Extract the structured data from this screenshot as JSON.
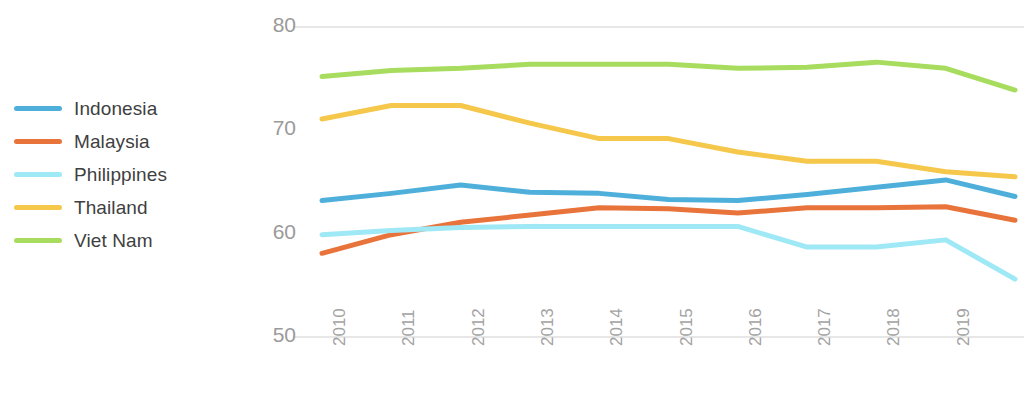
{
  "legend": {
    "position": "left",
    "items": [
      {
        "label": "Indonesia",
        "color": "#4FAFDB"
      },
      {
        "label": "Malaysia",
        "color": "#E8743B"
      },
      {
        "label": "Philippines",
        "color": "#9FE8F5"
      },
      {
        "label": "Thailand",
        "color": "#F5C84B"
      },
      {
        "label": "Viet Nam",
        "color": "#A8DC5E"
      }
    ]
  },
  "chart_data": {
    "type": "line",
    "title": "",
    "subtitle": "",
    "xlabel": "",
    "ylabel": "",
    "x": [
      2010,
      2011,
      2012,
      2013,
      2014,
      2015,
      2016,
      2017,
      2018,
      2019,
      2020
    ],
    "categories": [
      "2010",
      "2011",
      "2012",
      "2013",
      "2014",
      "2015",
      "2016",
      "2017",
      "2018",
      "2019",
      "2020"
    ],
    "ylim": [
      50,
      80
    ],
    "yticks": [
      50,
      60,
      70,
      80
    ],
    "ytick_labels": [
      "50",
      "60",
      "70",
      "80"
    ],
    "grid": "horizontal-top-and-bottom",
    "legend_position": "left",
    "series": [
      {
        "name": "Indonesia",
        "color": "#4FAFDB",
        "values": [
          63.2,
          63.9,
          64.7,
          64.0,
          63.9,
          63.3,
          63.2,
          63.8,
          64.5,
          65.2,
          63.6
        ]
      },
      {
        "name": "Malaysia",
        "color": "#E8743B",
        "values": [
          58.1,
          59.9,
          61.1,
          61.8,
          62.5,
          62.4,
          62.0,
          62.5,
          62.5,
          62.6,
          61.3
        ]
      },
      {
        "name": "Philippines",
        "color": "#9FE8F5",
        "values": [
          59.9,
          60.3,
          60.6,
          60.7,
          60.7,
          60.7,
          60.7,
          58.7,
          58.7,
          59.4,
          55.6
        ]
      },
      {
        "name": "Thailand",
        "color": "#F5C84B",
        "values": [
          71.1,
          72.4,
          72.4,
          70.7,
          69.2,
          69.2,
          67.9,
          67.0,
          67.0,
          66.0,
          65.5
        ]
      },
      {
        "name": "Viet Nam",
        "color": "#A8DC5E",
        "values": [
          75.2,
          75.8,
          76.0,
          76.4,
          76.4,
          76.4,
          76.0,
          76.1,
          76.6,
          76.0,
          73.9
        ]
      }
    ]
  }
}
